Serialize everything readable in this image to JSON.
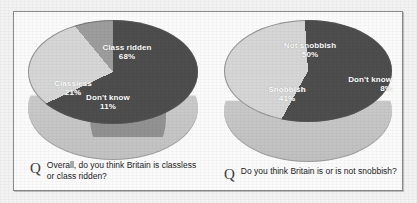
{
  "figure": {
    "question_marker": "Q"
  },
  "chart_data": [
    {
      "type": "pie",
      "title": "Overall, do you think Britain is classless or class ridden?",
      "categories": [
        "Class ridden",
        "Classless",
        "Don't know"
      ],
      "values": [
        68,
        21,
        11
      ],
      "value_labels": [
        "68%",
        "21%",
        "11%"
      ],
      "unit": "%",
      "colors": [
        "#4d4d4d",
        "#d6d6d6",
        "#9d9d9d"
      ],
      "legend": "none",
      "labels_inside": true,
      "three_d": true
    },
    {
      "type": "pie",
      "title": "Do you think Britain is or is not snobbish?",
      "categories": [
        "Not snobbish",
        "Snobbish",
        "Don't know"
      ],
      "values": [
        50,
        41,
        8
      ],
      "value_labels": [
        "50%",
        "41%",
        "8%"
      ],
      "unit": "%",
      "colors": [
        "#4d4d4d",
        "#d6d6d6",
        "#4d4d4d"
      ],
      "legend": "none",
      "labels_inside": true,
      "three_d": true
    }
  ],
  "left_chart": {
    "caption": "Overall, do you think Britain is classless or class ridden?",
    "slices": [
      {
        "label": "Class ridden",
        "pct": "68%"
      },
      {
        "label": "Classless",
        "pct": "21%"
      },
      {
        "label": "Don't know",
        "pct": "11%"
      }
    ]
  },
  "right_chart": {
    "caption": "Do you think Britain is or is not snobbish?",
    "slices": [
      {
        "label": "Not snobbish",
        "pct": "50%"
      },
      {
        "label": "Snobbish",
        "pct": "41%"
      },
      {
        "label": "Don't know",
        "pct": "8%"
      }
    ]
  }
}
